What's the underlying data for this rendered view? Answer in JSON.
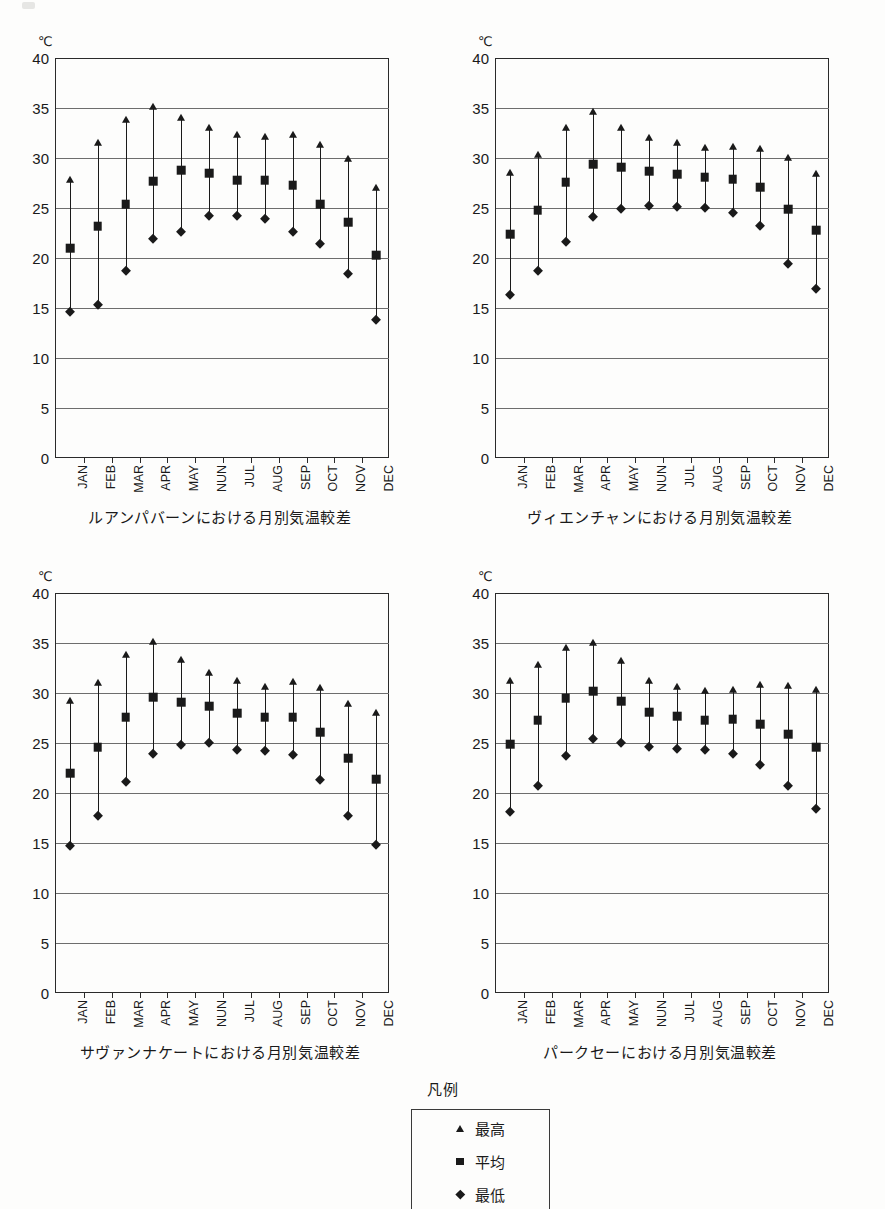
{
  "unit_label": "℃",
  "y_ticks": [
    0,
    5,
    10,
    15,
    20,
    25,
    30,
    35,
    40
  ],
  "months": [
    "JAN",
    "FEB",
    "MAR",
    "APR",
    "MAY",
    "NUN",
    "JUL",
    "AUG",
    "SEP",
    "OCT",
    "NOV",
    "DEC"
  ],
  "legend": {
    "title": "凡例",
    "items": [
      {
        "glyph": "triangle-up-icon",
        "label": "最高"
      },
      {
        "glyph": "square-icon",
        "label": "平均"
      },
      {
        "glyph": "diamond-icon",
        "label": "最低"
      }
    ]
  },
  "chart_data": [
    {
      "type": "scatter",
      "title": "ルアンパバーンにおける月別気温較差",
      "xlabel": "",
      "ylabel": "℃",
      "ylim": [
        0,
        40
      ],
      "ytick_step": 5,
      "grid": true,
      "categories": [
        "JAN",
        "FEB",
        "MAR",
        "APR",
        "MAY",
        "NUN",
        "JUL",
        "AUG",
        "SEP",
        "OCT",
        "NOV",
        "DEC"
      ],
      "series": [
        {
          "name": "最高",
          "values": [
            27.8,
            31.5,
            33.8,
            35.1,
            34.0,
            33.0,
            32.3,
            32.1,
            32.3,
            31.3,
            29.9,
            27.0
          ]
        },
        {
          "name": "平均",
          "values": [
            21.0,
            23.2,
            25.4,
            27.7,
            28.8,
            28.5,
            27.8,
            27.8,
            27.3,
            25.4,
            23.6,
            20.3
          ]
        },
        {
          "name": "最低",
          "values": [
            14.6,
            15.3,
            18.7,
            21.9,
            22.6,
            24.2,
            24.2,
            23.9,
            22.6,
            21.4,
            18.4,
            13.8
          ]
        }
      ]
    },
    {
      "type": "scatter",
      "title": "ヴィエンチャンにおける月別気温較差",
      "xlabel": "",
      "ylabel": "℃",
      "ylim": [
        0,
        40
      ],
      "ytick_step": 5,
      "grid": true,
      "categories": [
        "JAN",
        "FEB",
        "MAR",
        "APR",
        "MAY",
        "NUN",
        "JUL",
        "AUG",
        "SEP",
        "OCT",
        "NOV",
        "DEC"
      ],
      "series": [
        {
          "name": "最高",
          "values": [
            28.5,
            30.3,
            33.0,
            34.6,
            33.0,
            32.0,
            31.5,
            31.0,
            31.1,
            30.9,
            30.0,
            28.4
          ]
        },
        {
          "name": "平均",
          "values": [
            22.4,
            24.8,
            27.6,
            29.4,
            29.1,
            28.7,
            28.4,
            28.1,
            27.9,
            27.1,
            24.9,
            22.8
          ]
        },
        {
          "name": "最低",
          "values": [
            16.3,
            18.7,
            21.6,
            24.1,
            24.9,
            25.2,
            25.1,
            25.0,
            24.5,
            23.2,
            19.4,
            16.9
          ]
        }
      ]
    },
    {
      "type": "scatter",
      "title": "サヴァンナケートにおける月別気温較差",
      "xlabel": "",
      "ylabel": "℃",
      "ylim": [
        0,
        40
      ],
      "ytick_step": 5,
      "grid": true,
      "categories": [
        "JAN",
        "FEB",
        "MAR",
        "APR",
        "MAY",
        "NUN",
        "JUL",
        "AUG",
        "SEP",
        "OCT",
        "NOV",
        "DEC"
      ],
      "series": [
        {
          "name": "最高",
          "values": [
            29.2,
            31.0,
            33.8,
            35.1,
            33.3,
            32.0,
            31.2,
            30.6,
            31.1,
            30.5,
            28.9,
            28.0
          ]
        },
        {
          "name": "平均",
          "values": [
            22.0,
            24.6,
            27.6,
            29.6,
            29.1,
            28.7,
            28.0,
            27.6,
            27.6,
            26.1,
            23.5,
            21.4
          ]
        },
        {
          "name": "最低",
          "values": [
            14.7,
            17.7,
            21.1,
            23.9,
            24.8,
            25.0,
            24.3,
            24.2,
            23.8,
            21.3,
            17.7,
            14.8
          ]
        }
      ]
    },
    {
      "type": "scatter",
      "title": "パークセーにおける月別気温較差",
      "xlabel": "",
      "ylabel": "℃",
      "ylim": [
        0,
        40
      ],
      "ytick_step": 5,
      "grid": true,
      "categories": [
        "JAN",
        "FEB",
        "MAR",
        "APR",
        "MAY",
        "NUN",
        "JUL",
        "AUG",
        "SEP",
        "OCT",
        "NOV",
        "DEC"
      ],
      "series": [
        {
          "name": "最高",
          "values": [
            31.2,
            32.8,
            34.5,
            35.0,
            33.2,
            31.2,
            30.6,
            30.2,
            30.3,
            30.8,
            30.7,
            30.3
          ]
        },
        {
          "name": "平均",
          "values": [
            24.9,
            27.3,
            29.5,
            30.2,
            29.2,
            28.1,
            27.7,
            27.3,
            27.4,
            26.9,
            25.9,
            24.6
          ]
        },
        {
          "name": "最低",
          "values": [
            18.1,
            20.7,
            23.7,
            25.4,
            25.0,
            24.6,
            24.4,
            24.3,
            23.9,
            22.8,
            20.7,
            18.4
          ]
        }
      ]
    }
  ]
}
